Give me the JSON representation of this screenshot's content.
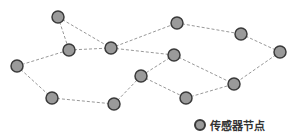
{
  "diagram": {
    "type": "wireless-sensor-network",
    "node_style": {
      "fill": "#9a9a9a",
      "stroke": "#3a3a3a",
      "radius": 6
    },
    "edge_style": {
      "stroke": "#999999",
      "dash": "3,2"
    },
    "nodes": [
      {
        "id": "A",
        "x": 58,
        "y": 17
      },
      {
        "id": "B",
        "x": 69,
        "y": 50
      },
      {
        "id": "C",
        "x": 17,
        "y": 66
      },
      {
        "id": "D",
        "x": 52,
        "y": 98
      },
      {
        "id": "E",
        "x": 111,
        "y": 48
      },
      {
        "id": "F",
        "x": 177,
        "y": 23
      },
      {
        "id": "G",
        "x": 174,
        "y": 55
      },
      {
        "id": "H",
        "x": 141,
        "y": 76
      },
      {
        "id": "I",
        "x": 186,
        "y": 98
      },
      {
        "id": "J",
        "x": 241,
        "y": 34
      },
      {
        "id": "K",
        "x": 280,
        "y": 52
      },
      {
        "id": "L",
        "x": 234,
        "y": 84
      },
      {
        "id": "M",
        "x": 114,
        "y": 104
      }
    ],
    "edges": [
      [
        "A",
        "B"
      ],
      [
        "A",
        "E"
      ],
      [
        "C",
        "B"
      ],
      [
        "B",
        "E"
      ],
      [
        "E",
        "F"
      ],
      [
        "E",
        "G"
      ],
      [
        "F",
        "J"
      ],
      [
        "J",
        "K"
      ],
      [
        "K",
        "L"
      ],
      [
        "G",
        "L"
      ],
      [
        "G",
        "H"
      ],
      [
        "H",
        "I"
      ],
      [
        "I",
        "L"
      ],
      [
        "C",
        "D"
      ],
      [
        "D",
        "M"
      ],
      [
        "M",
        "H"
      ]
    ]
  },
  "legend": {
    "label": "传感器节点",
    "icon": "sensor-node-icon"
  }
}
